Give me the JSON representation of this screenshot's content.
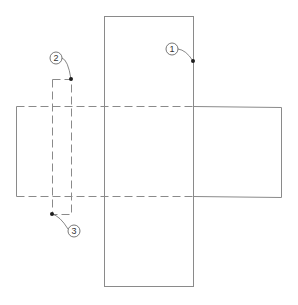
{
  "diagram": {
    "colors": {
      "line": "#8a8a8a",
      "dot": "#1e1e1e",
      "callout_circle": "#555555",
      "background": "#ffffff"
    },
    "shapes": {
      "vertical_panel": {
        "x": 104,
        "y": 16,
        "width": 89,
        "height": 270,
        "style": "solid"
      },
      "horizontal_panel": {
        "x": 16,
        "y": 106,
        "width": 265,
        "height": 90,
        "style": "solid right portion, dashed (hidden) left of vertical panel right edge",
        "dashed_until_x": 193
      },
      "slot": {
        "x": 52,
        "y": 79,
        "width": 19,
        "height": 135,
        "style": "dashed"
      }
    },
    "callouts": [
      {
        "label": "1",
        "circle": {
          "cx": 172,
          "cy": 49,
          "r": 6
        },
        "point": {
          "x": 193,
          "y": 61
        }
      },
      {
        "label": "2",
        "circle": {
          "cx": 56,
          "cy": 58,
          "r": 6
        },
        "point": {
          "x": 71,
          "y": 79
        }
      },
      {
        "label": "3",
        "circle": {
          "cx": 74,
          "cy": 231,
          "r": 6
        },
        "point": {
          "x": 52,
          "y": 214
        }
      }
    ]
  }
}
